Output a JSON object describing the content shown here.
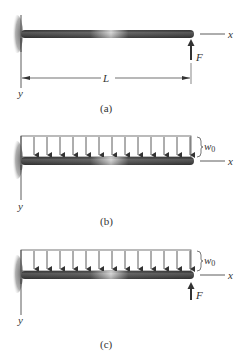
{
  "figures": [
    {
      "id": "a",
      "caption": "(a)",
      "labels": {
        "x_axis": "x",
        "y_axis": "y",
        "force": "F",
        "length": "L"
      },
      "has_distributed_load": false,
      "has_point_force": true
    },
    {
      "id": "b",
      "caption": "(b)",
      "labels": {
        "x_axis": "x",
        "y_axis": "y",
        "load": "w0"
      },
      "has_distributed_load": true,
      "load_arrow_count": 14,
      "has_point_force": false
    },
    {
      "id": "c",
      "caption": "(c)",
      "labels": {
        "x_axis": "x",
        "y_axis": "y",
        "load": "w0",
        "force": "F"
      },
      "has_distributed_load": true,
      "load_arrow_count": 14,
      "has_point_force": true
    }
  ],
  "colors": {
    "beam": "#3a3a3a",
    "beam_highlight": "#d8d8d8",
    "line": "#333333",
    "wall": "#9a9a9a"
  }
}
